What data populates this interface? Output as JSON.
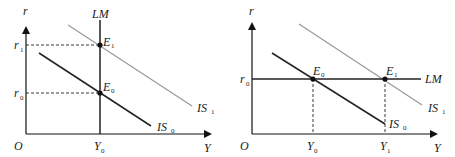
{
  "left_panel": {
    "axes": {
      "y_label": "r",
      "x_label": "Y",
      "origin": "O"
    },
    "curves": {
      "lm": {
        "label": "LM",
        "color": "#222222"
      },
      "is0": {
        "label": "IS",
        "sub": "0",
        "color": "#222222"
      },
      "is1": {
        "label": "IS",
        "sub": "1",
        "color": "#999999"
      }
    },
    "points": {
      "e0": {
        "label": "E",
        "sub": "0"
      },
      "e1": {
        "label": "E",
        "sub": "1"
      }
    },
    "ticks": {
      "r1": {
        "label": "r",
        "sub": "1"
      },
      "r0": {
        "label": "r",
        "sub": "0"
      },
      "y0": {
        "label": "Y",
        "sub": "0"
      }
    }
  },
  "right_panel": {
    "axes": {
      "y_label": "r",
      "x_label": "Y",
      "origin": "O"
    },
    "curves": {
      "lm": {
        "label": "LM",
        "color": "#222222"
      },
      "is0": {
        "label": "IS",
        "sub": "0",
        "color": "#222222"
      },
      "is1": {
        "label": "IS",
        "sub": "1",
        "color": "#999999"
      }
    },
    "points": {
      "e0": {
        "label": "E",
        "sub": "0"
      },
      "e1": {
        "label": "E",
        "sub": "1"
      }
    },
    "ticks": {
      "r0": {
        "label": "r",
        "sub": "0"
      },
      "y0": {
        "label": "Y",
        "sub": "0"
      },
      "y1": {
        "label": "Y",
        "sub": "1"
      }
    }
  }
}
